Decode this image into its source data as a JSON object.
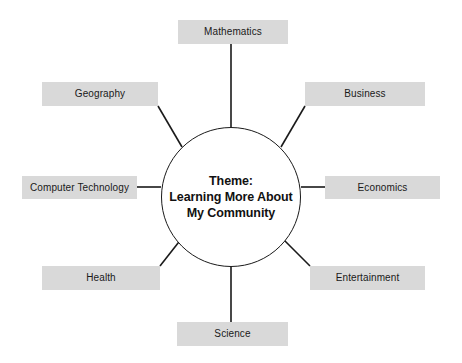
{
  "diagram": {
    "type": "web-cluster-diagram",
    "center": {
      "shape": "circle",
      "lines": [
        "Theme:",
        "Learning More About",
        "My Community"
      ],
      "text": "Theme: Learning More About My Community",
      "cx": 231,
      "cy": 197,
      "r": 70
    },
    "style": {
      "box_fill": "#d9d9d9",
      "line_color": "#1a1a1a",
      "text_color": "#1a1a1a",
      "background": "#ffffff"
    },
    "nodes": [
      {
        "id": "mathematics",
        "label": "Mathematics",
        "position": "top",
        "x": 178,
        "y": 20,
        "w": 110,
        "h": 24,
        "line": {
          "x1": 231,
          "y1": 44,
          "x2": 231,
          "y2": 127
        }
      },
      {
        "id": "business",
        "label": "Business",
        "position": "top-right",
        "x": 305,
        "y": 82,
        "w": 120,
        "h": 24,
        "line": {
          "x1": 305,
          "y1": 106,
          "x2": 281,
          "y2": 147
        }
      },
      {
        "id": "economics",
        "label": "Economics",
        "position": "right",
        "x": 325,
        "y": 176,
        "w": 115,
        "h": 23,
        "line": {
          "x1": 325,
          "y1": 187,
          "x2": 301,
          "y2": 187
        }
      },
      {
        "id": "entertainment",
        "label": "Entertainment",
        "position": "bottom-right",
        "x": 310,
        "y": 266,
        "w": 115,
        "h": 24,
        "line": {
          "x1": 310,
          "y1": 266,
          "x2": 281,
          "y2": 237
        }
      },
      {
        "id": "science",
        "label": "Science",
        "position": "bottom",
        "x": 177,
        "y": 322,
        "w": 111,
        "h": 24,
        "line": {
          "x1": 231,
          "y1": 322,
          "x2": 231,
          "y2": 267
        }
      },
      {
        "id": "health",
        "label": "Health",
        "position": "bottom-left",
        "x": 42,
        "y": 266,
        "w": 118,
        "h": 24,
        "line": {
          "x1": 160,
          "y1": 266,
          "x2": 182,
          "y2": 238
        }
      },
      {
        "id": "computer-technology",
        "label": "Computer Technology",
        "position": "left",
        "x": 22,
        "y": 176,
        "w": 115,
        "h": 23,
        "line": {
          "x1": 137,
          "y1": 187,
          "x2": 161,
          "y2": 187
        }
      },
      {
        "id": "geography",
        "label": "Geography",
        "position": "top-left",
        "x": 42,
        "y": 82,
        "w": 116,
        "h": 24,
        "line": {
          "x1": 158,
          "y1": 106,
          "x2": 182,
          "y2": 147
        }
      }
    ]
  }
}
